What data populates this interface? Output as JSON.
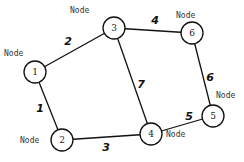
{
  "graph": {
    "node_label": "Node",
    "nodes": [
      {
        "id": "1",
        "x": 35,
        "y": 72,
        "label_x": 4,
        "label_y": 56
      },
      {
        "id": "2",
        "x": 62,
        "y": 140,
        "label_x": 20,
        "label_y": 143
      },
      {
        "id": "3",
        "x": 114,
        "y": 28,
        "label_x": 70,
        "label_y": 13
      },
      {
        "id": "4",
        "x": 151,
        "y": 134,
        "label_x": 166,
        "label_y": 137
      },
      {
        "id": "5",
        "x": 213,
        "y": 116,
        "label_x": 216,
        "label_y": 98
      },
      {
        "id": "6",
        "x": 192,
        "y": 33,
        "label_x": 176,
        "label_y": 18
      }
    ],
    "edges": [
      {
        "from": "2",
        "to": "1",
        "weight": "1",
        "wx": 40,
        "wy": 108
      },
      {
        "from": "1",
        "to": "3",
        "weight": "2",
        "wx": 68,
        "wy": 41
      },
      {
        "from": "2",
        "to": "4",
        "weight": "3",
        "wx": 106,
        "wy": 147
      },
      {
        "from": "3",
        "to": "6",
        "weight": "4",
        "wx": 155,
        "wy": 20
      },
      {
        "from": "4",
        "to": "5",
        "weight": "5",
        "wx": 189,
        "wy": 116
      },
      {
        "from": "6",
        "to": "5",
        "weight": "6",
        "wx": 210,
        "wy": 77
      },
      {
        "from": "3",
        "to": "4",
        "weight": "7",
        "wx": 141,
        "wy": 84
      }
    ]
  }
}
